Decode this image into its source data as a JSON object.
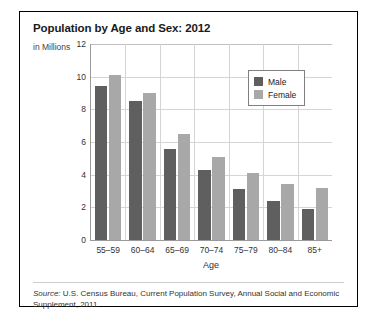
{
  "chart_data": {
    "type": "bar",
    "title": "Population by Age and Sex: 2012",
    "ylabel": "in Millions",
    "xlabel": "Age",
    "categories": [
      "55–59",
      "60–64",
      "65–69",
      "70–74",
      "75–79",
      "80–84",
      "85+"
    ],
    "series": [
      {
        "name": "Male",
        "color": "#5f5f5f",
        "values": [
          9.4,
          8.5,
          5.6,
          4.3,
          3.1,
          2.4,
          1.9
        ]
      },
      {
        "name": "Female",
        "color": "#a8a8a8",
        "values": [
          10.1,
          9.0,
          6.5,
          5.1,
          4.1,
          3.4,
          3.2
        ]
      }
    ],
    "ylim": [
      0,
      12
    ],
    "yticks": [
      0,
      2,
      4,
      6,
      8,
      10,
      12
    ],
    "ytick_labels": [
      "0",
      "2",
      "4",
      "6",
      "8",
      "10",
      "12"
    ],
    "grid": true,
    "legend_position": "top-right"
  },
  "legend": {
    "items": [
      {
        "label": "Male"
      },
      {
        "label": "Female"
      }
    ]
  },
  "footer": {
    "source_label": "Source:",
    "source_text": " U.S. Census Bureau, Current Population Survey, Annual Social and Economic Supplement, 2011."
  }
}
